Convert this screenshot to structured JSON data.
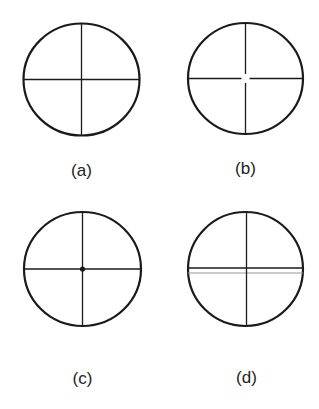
{
  "figure": {
    "stroke_color": "#1a1a1a",
    "light_line_color": "#9a9a9a",
    "panels": [
      {
        "id": "a",
        "label": "(a)",
        "variant": "solid-crosshair",
        "circle": {
          "cx": 81.5,
          "cy": 79.5,
          "rx": 58,
          "ry": 56
        },
        "label_pos": {
          "x": 81.5,
          "y": 176
        }
      },
      {
        "id": "b",
        "label": "(b)",
        "variant": "crosshair-with-center-gap",
        "circle": {
          "cx": 245.5,
          "cy": 78.5,
          "rx": 57.5,
          "ry": 55.5
        },
        "label_pos": {
          "x": 245.5,
          "y": 174
        }
      },
      {
        "id": "c",
        "label": "(c)",
        "variant": "crosshair-with-center-dot",
        "circle": {
          "cx": 82.5,
          "cy": 269,
          "rx": 58.5,
          "ry": 57
        },
        "label_pos": {
          "x": 82.5,
          "y": 384
        }
      },
      {
        "id": "d",
        "label": "(d)",
        "variant": "crosshair-with-double-horizontal",
        "circle": {
          "cx": 245.5,
          "cy": 269,
          "rx": 57.5,
          "ry": 57
        },
        "label_pos": {
          "x": 246.5,
          "y": 383
        }
      }
    ]
  }
}
